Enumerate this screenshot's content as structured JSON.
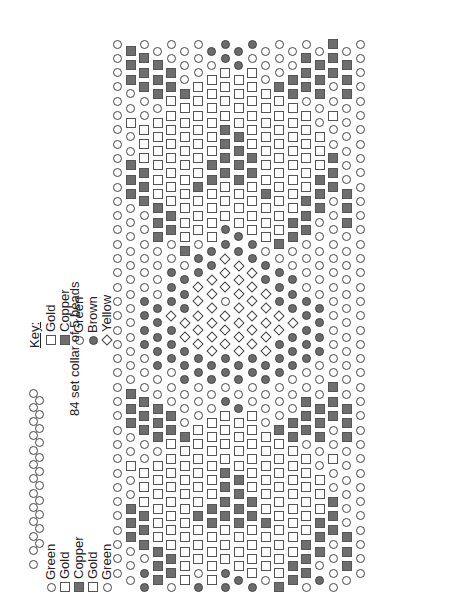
{
  "key": {
    "title": "Key:",
    "items": [
      {
        "code": "g",
        "label": "Gold",
        "shape": "open-square"
      },
      {
        "code": "C",
        "label": "Copper",
        "shape": "filled-square"
      },
      {
        "code": "G",
        "label": "Green",
        "shape": "open-circle"
      },
      {
        "code": "B",
        "label": "Brown",
        "shape": "filled-circle"
      },
      {
        "code": "Y",
        "label": "Yellow",
        "shape": "open-diamond"
      }
    ]
  },
  "collar": {
    "note": "84 set collar of 5 beads",
    "sequence": [
      {
        "code": "G",
        "label": "Green"
      },
      {
        "code": "g",
        "label": "Gold"
      },
      {
        "code": "C",
        "label": "Copper"
      },
      {
        "code": "g",
        "label": "Gold"
      },
      {
        "code": "G",
        "label": "Green"
      }
    ],
    "edge_beads": 13
  },
  "colors": {
    "outline": "#444444",
    "copper_fill": "#6e6e6e",
    "brown_fill": "#6b6b6b",
    "background": "#ffffff"
  },
  "grid": {
    "columns": 19,
    "origin_x": 117,
    "origin_y": 44,
    "col_spacing": 13.5,
    "row_spacing": 14.3,
    "odd_col_offset": 7,
    "columns_data": [
      "GGGGGGGGGGGGGGGGGGGGGGGGGGGGGGGGGGGGGG",
      "CCCGGgGGCCCGGGGGGGGGGGGGCCCGGgGGCCCGGGG",
      "GCCCGGgggCCCGGGGGGBBBBGGGCCCGGgggCCCGBBGG",
      "GCCCGggggggCCCGGGGBBBBBGGCCCGggggggCCCGBBBGG",
      "GGCCggggggggCCGGBBBYBBBGGGCCggggggggCCGBBBYGG",
      "GGGCggggggggggCGBBBYYBBBGGGCggggggggggCGBBYYGG",
      "GGGgggggggCgggGBBYYYYYBBGGGggggggCgggGBBYYYYG",
      "BGggggggCCggggBBYYYYYYBBGGggggggCCggggBBYYYYG",
      "BBggggCCCCgggBBYYYGYYYBBGBggggCCCCgggBBYYGYYG",
      "BBggggCCCCgggBBYYYYYYYBBGBggggCCCCgggBBYYYYYG",
      "BGggggggCCggggBBYYYYYYBBGGggggggCCggggBBYYYYG",
      "GGGgggggggCgggGBBYYYYYBBGGGggggggCgggGBBYYYYG",
      "GGGCggggggggggCGBBBYYBBBGGGCggggggggggCGBBYYGG",
      "GGCCggggggggCCGGBBBYBBBGGGCCggggggggCCGBBBYGG",
      "GCCCGggggggCCCGGGGBBBBBGGCCCGggggggCCCGBBBGG",
      "GCCCGGgggCCCGGGGGGBBBBGGGCCCGGgggCCCGBBGG",
      "CCCGGgGGCCCGGGGGGGGGGGGGCCCGGgGGCCCGGGG",
      "GCCCGGGGGGCCCGGGGGGGGGGGGCCCGGGGGGCCCGGG",
      "GGGGGGGGGGGGGGGGGGGGGGGGGGGGGGGGGGGGGG"
    ]
  }
}
